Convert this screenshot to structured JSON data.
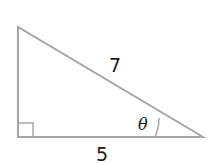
{
  "diagram": {
    "type": "right-triangle",
    "hypotenuse_label": "7",
    "adjacent_label": "5",
    "angle_label": "θ",
    "right_angle_marker": true,
    "stroke_color": "#a6a6a6",
    "text_color": "#1a1a1a"
  }
}
